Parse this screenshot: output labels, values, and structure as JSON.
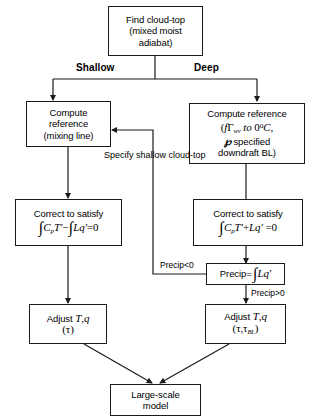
{
  "diagram": {
    "stroke_color": "#1a1a1a",
    "background": "#ffffff",
    "nodes": {
      "find_cloud_top": {
        "id": "find-cloud-top",
        "lines": [
          "Find cloud-top",
          "(mixed moist",
          "adiabat)"
        ]
      },
      "compute_ref_shallow": {
        "id": "compute-reference-shallow",
        "lines": [
          "Compute",
          "reference",
          "(mixing line)"
        ]
      },
      "compute_ref_deep": {
        "id": "compute-reference-deep",
        "lines": [
          "Compute reference"
        ],
        "formula_line1": "( fΓwv to 0°C,",
        "formula_line2": "℘ specified",
        "formula_line3": "downdraft BL )"
      },
      "correct_shallow": {
        "id": "correct-to-satisfy-shallow",
        "lines": [
          "Correct to satisfy"
        ],
        "formula": "∫CpT′ − ∫Lq′ = 0"
      },
      "correct_deep": {
        "id": "correct-to-satisfy-deep",
        "lines": [
          "Correct to satisfy"
        ],
        "formula": "∫CpT′ + Lq′ = 0"
      },
      "precip": {
        "id": "precip",
        "label": "Precip=",
        "formula": "∫Lq′"
      },
      "adjust_shallow": {
        "id": "adjust-shallow",
        "lines": [
          "Adjust T,q",
          "(τ)"
        ]
      },
      "adjust_deep": {
        "id": "adjust-deep",
        "lines": [
          "Adjust T,q",
          "(τ,τBL)"
        ]
      },
      "large_scale_model": {
        "id": "large-scale-model",
        "lines": [
          "Large-scale",
          "model"
        ]
      }
    },
    "branch_labels": {
      "shallow": "Shallow",
      "deep": "Deep"
    },
    "edge_labels": {
      "specify_shallow_cloud_top": [
        "Specify",
        "shallow",
        "cloud-top"
      ],
      "precip_negative": "Precip<0",
      "precip_positive": "Precip>0"
    }
  }
}
